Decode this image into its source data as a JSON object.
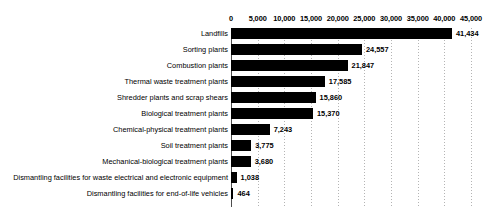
{
  "chart_data": {
    "type": "bar",
    "orientation": "horizontal",
    "title": "",
    "xlabel": "",
    "ylabel": "",
    "xlim": [
      0,
      45000
    ],
    "xticks": [
      0,
      5000,
      10000,
      15000,
      20000,
      25000,
      30000,
      35000,
      40000,
      45000
    ],
    "xtick_labels": [
      "0",
      "5,000",
      "10,000",
      "15,000",
      "20,000",
      "25,000",
      "30,000",
      "35,000",
      "40,000",
      "45,000"
    ],
    "grid": true,
    "grid_axis": "x",
    "legend": false,
    "bar_color": "#000000",
    "grid_color": "#b4b4b4",
    "categories": [
      "Landfills",
      "Sorting plants",
      "Combustion plants",
      "Thermal waste treatment plants",
      "Shredder plants and scrap shears",
      "Biological treatment plants",
      "Chemical-physical treatment plants",
      "Soil treatment plants",
      "Mechanical-biological treatment plants",
      "Dismantling facilities for waste electrical and electronic equipment",
      "Dismantling facilities for end-of-life vehicles"
    ],
    "values": [
      41434,
      24557,
      21847,
      17585,
      15860,
      15370,
      7243,
      3775,
      3680,
      1038,
      464
    ],
    "value_labels": [
      "41,434",
      "24,557",
      "21,847",
      "17,585",
      "15,860",
      "15,370",
      "7,243",
      "3,775",
      "3,680",
      "1,038",
      "464"
    ]
  }
}
